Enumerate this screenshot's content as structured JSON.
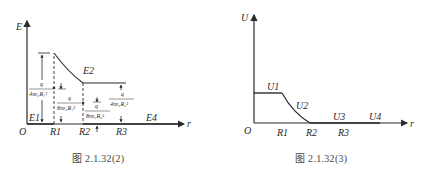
{
  "figures": [
    {
      "id": "left",
      "caption": "图 2.1.32(2)",
      "y_axis_label": "E",
      "x_axis_label": "r",
      "origin_label": "O",
      "x_ticks": [
        "R1",
        "R2",
        "R3"
      ],
      "region_labels": [
        "E1",
        "E2",
        "E4"
      ],
      "annotations": [
        {
          "num": "q",
          "den": "4πε₀R₁²",
          "at": "R1 (peak)"
        },
        {
          "num": "q",
          "den": "8πε₀R₁²",
          "at": "R1 (midpoint)"
        },
        {
          "num": "q",
          "den": "8πε₀R₂²",
          "at": "R2 (midpoint)"
        },
        {
          "num": "q",
          "den": "4πε₀R₂²",
          "at": "R3 (plateau)"
        }
      ]
    },
    {
      "id": "right",
      "caption": "图 2.1.32(3)",
      "y_axis_label": "U",
      "x_axis_label": "r",
      "origin_label": "O",
      "x_ticks": [
        "R1",
        "R2",
        "R3"
      ],
      "region_labels": [
        "U1",
        "U2",
        "U3",
        "U4"
      ]
    }
  ]
}
